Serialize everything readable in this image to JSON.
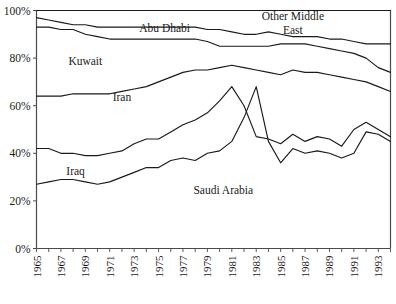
{
  "chart_data": {
    "type": "line",
    "title": "",
    "subtitle": "",
    "xlabel": "",
    "ylabel": "",
    "grid": false,
    "legend_position": "inline-annotations",
    "xlim": [
      1965,
      1994
    ],
    "ylim": [
      0,
      100
    ],
    "y_ticks": [
      "0%",
      "20%",
      "40%",
      "60%",
      "80%",
      "100%"
    ],
    "y_tick_values": [
      0,
      20,
      40,
      60,
      80,
      100
    ],
    "x_ticks": [
      "1965",
      "1967",
      "1969",
      "1971",
      "1973",
      "1975",
      "1977",
      "1979",
      "1981",
      "1983",
      "1985",
      "1987",
      "1989",
      "1991",
      "1993"
    ],
    "x_tick_values": [
      1965,
      1967,
      1969,
      1971,
      1973,
      1975,
      1977,
      1979,
      1981,
      1983,
      1985,
      1987,
      1989,
      1991,
      1993
    ],
    "x_minor_ticks": [
      1965,
      1966,
      1967,
      1968,
      1969,
      1970,
      1971,
      1972,
      1973,
      1974,
      1975,
      1976,
      1977,
      1978,
      1979,
      1980,
      1981,
      1982,
      1983,
      1984,
      1985,
      1986,
      1987,
      1988,
      1989,
      1990,
      1991,
      1992,
      1993,
      1994
    ],
    "x": [
      1965,
      1966,
      1967,
      1968,
      1969,
      1970,
      1971,
      1972,
      1973,
      1974,
      1975,
      1976,
      1977,
      1978,
      1979,
      1980,
      1981,
      1982,
      1983,
      1984,
      1985,
      1986,
      1987,
      1988,
      1989,
      1990,
      1991,
      1992,
      1993,
      1994
    ],
    "series": [
      {
        "name": "Saudi Arabia",
        "label": "Saudi Arabia",
        "label_x": 1980.3,
        "label_y": 23,
        "values": [
          27,
          28,
          29,
          29,
          28,
          27,
          28,
          30,
          32,
          34,
          34,
          37,
          38,
          37,
          40,
          41,
          45,
          55,
          68,
          45,
          36,
          42,
          40,
          41,
          40,
          38,
          40,
          49,
          48,
          45
        ]
      },
      {
        "name": "Iraq",
        "label": "Iraq",
        "label_x": 1968.2,
        "label_y": 31,
        "values": [
          42,
          42,
          40,
          40,
          39,
          39,
          40,
          41,
          44,
          46,
          46,
          49,
          52,
          54,
          57,
          62,
          68,
          60,
          47,
          46,
          44,
          48,
          45,
          47,
          46,
          43,
          50,
          53,
          50,
          47
        ]
      },
      {
        "name": "Iran",
        "label": "Iran",
        "label_x": 1972.0,
        "label_y": 62,
        "values": [
          64,
          64,
          64,
          65,
          65,
          65,
          65,
          66,
          67,
          68,
          70,
          72,
          74,
          75,
          75,
          76,
          77,
          76,
          75,
          74,
          73,
          75,
          74,
          74,
          73,
          72,
          71,
          70,
          68,
          66
        ]
      },
      {
        "name": "Kuwait",
        "label": "Kuwait",
        "label_x": 1969.0,
        "label_y": 77,
        "values": [
          93,
          93,
          92,
          92,
          90,
          89,
          88,
          88,
          88,
          88,
          88,
          88,
          88,
          88,
          87,
          85,
          85,
          85,
          85,
          85,
          86,
          86,
          86,
          85,
          84,
          83,
          82,
          80,
          76,
          74
        ]
      },
      {
        "name": "Abu Dhabi",
        "label": "Abu Dhabi",
        "label_x": 1975.5,
        "label_y": 91,
        "values": [
          97,
          96,
          95,
          94,
          94,
          93,
          93,
          93,
          93,
          93,
          93,
          93,
          93,
          93,
          92,
          92,
          91,
          90,
          90,
          91,
          90,
          89,
          89,
          89,
          88,
          88,
          87,
          86,
          86,
          86
        ]
      },
      {
        "name": "Other Middle East",
        "label": "Other Middle East",
        "label_line_1": "Other Middle",
        "label_line_2": "East",
        "label_x": 1986.0,
        "label_y": 96,
        "values": [
          100,
          100,
          100,
          100,
          100,
          100,
          100,
          100,
          100,
          100,
          100,
          100,
          100,
          100,
          100,
          100,
          100,
          100,
          100,
          100,
          100,
          100,
          100,
          100,
          100,
          100,
          100,
          100,
          100,
          100
        ]
      }
    ],
    "colors": {
      "line": "#1a1a1a",
      "axis": "#4a4a4a",
      "background": "#ffffff",
      "text": "#1a1a1a"
    }
  }
}
